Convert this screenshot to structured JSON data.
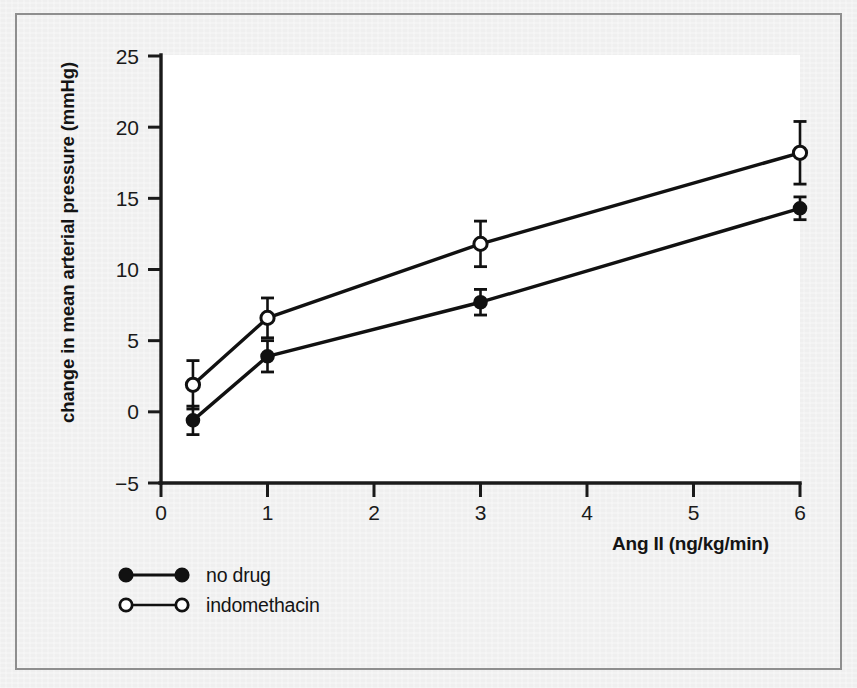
{
  "figure": {
    "background_color": "#efefef",
    "plot_background_color": "#ffffff",
    "frame_color": "#8e8e8e",
    "ink_color": "#111111"
  },
  "chart_data": {
    "type": "line",
    "title": "",
    "subtitle": "",
    "xlabel": "Ang II (ng/kg/min)",
    "ylabel": "change in mean arterial pressure (mmHg)",
    "xlim": [
      0,
      6
    ],
    "ylim": [
      -5,
      25
    ],
    "xticks": [
      0,
      1,
      2,
      3,
      4,
      5,
      6
    ],
    "xticklabels": [
      "0",
      "1",
      "2",
      "3",
      "4",
      "5",
      "6"
    ],
    "yticks": [
      -5,
      0,
      5,
      10,
      15,
      20,
      25
    ],
    "yticklabels": [
      "−5",
      "0",
      "5",
      "10",
      "15",
      "20",
      "25"
    ],
    "grid": false,
    "legend_position": "below-axes-left",
    "error_bars": "symmetric",
    "series": [
      {
        "name": "no drug",
        "marker": "filled-circle",
        "x": [
          0.3,
          1.0,
          3.0,
          6.0
        ],
        "values": [
          -0.6,
          3.9,
          7.7,
          14.3
        ],
        "errors": [
          1.0,
          1.1,
          0.9,
          0.8
        ]
      },
      {
        "name": "indomethacin",
        "marker": "open-circle",
        "x": [
          0.3,
          1.0,
          3.0,
          6.0
        ],
        "values": [
          1.9,
          6.6,
          11.8,
          18.2
        ],
        "errors": [
          1.7,
          1.4,
          1.6,
          2.2
        ]
      }
    ]
  },
  "legend": {
    "entries": [
      {
        "label": "no drug",
        "marker": "filled-circle"
      },
      {
        "label": "indomethacin",
        "marker": "open-circle"
      }
    ]
  }
}
